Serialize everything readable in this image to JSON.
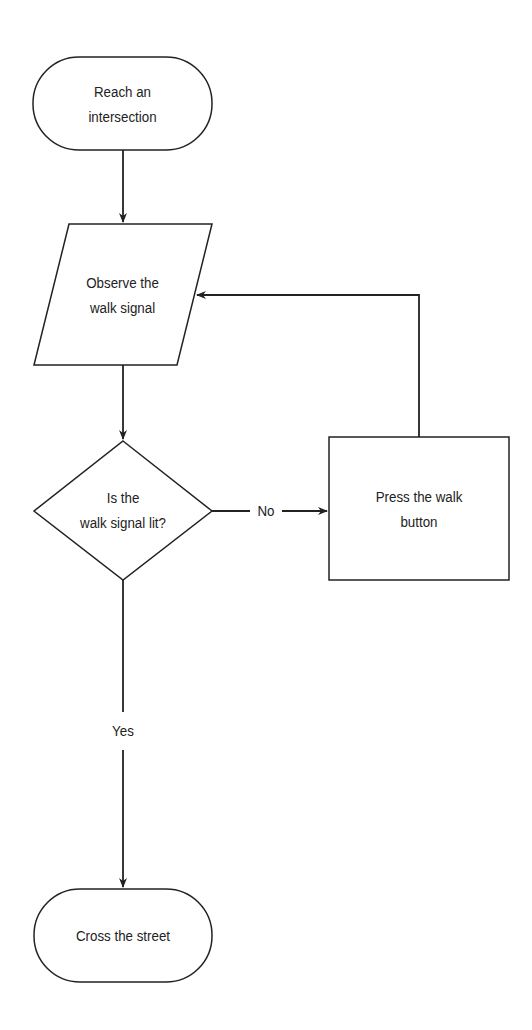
{
  "diagram": {
    "type": "flowchart",
    "stroke_color": "#222222",
    "background": "#ffffff",
    "nodes": [
      {
        "id": "start",
        "shape": "terminal",
        "label": "Reach an\nintersection"
      },
      {
        "id": "observe",
        "shape": "parallelogram",
        "label": "Observe the\nwalk signal"
      },
      {
        "id": "decision",
        "shape": "diamond",
        "label": "Is the\nwalk signal lit?"
      },
      {
        "id": "press",
        "shape": "rectangle",
        "label": "Press the walk\nbutton"
      },
      {
        "id": "end",
        "shape": "terminal",
        "label": "Cross the street"
      }
    ],
    "edges": [
      {
        "from": "start",
        "to": "observe",
        "label": ""
      },
      {
        "from": "observe",
        "to": "decision",
        "label": ""
      },
      {
        "from": "decision",
        "to": "press",
        "label": "No"
      },
      {
        "from": "press",
        "to": "observe",
        "label": ""
      },
      {
        "from": "decision",
        "to": "end",
        "label": "Yes"
      }
    ]
  }
}
